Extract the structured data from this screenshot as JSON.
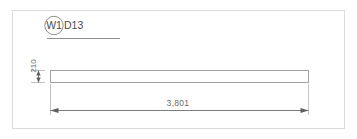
{
  "drawing": {
    "type": "structural-beam-elevation",
    "frame": {
      "border_color": "#d8d8d8",
      "background": "#ffffff"
    },
    "mark": {
      "circle_label": "W1",
      "section_label": "D13",
      "combined": "W1 D13",
      "balloon_shape": "circle",
      "underline": true
    },
    "member": {
      "outline_color": "#9a9a9a",
      "shape": "rectangle",
      "depth_label": "210",
      "length_label": "3,801"
    },
    "dimensions": [
      {
        "name": "depth",
        "value": "210",
        "orientation": "vertical",
        "arrow_style": "filled-arrowheads",
        "color": "#6a6a6a"
      },
      {
        "name": "length",
        "value": "3,801",
        "orientation": "horizontal",
        "arrow_style": "filled-arrowheads",
        "color": "#6a6a6a"
      }
    ],
    "line_colors": {
      "outline": "#9a9a9a",
      "dimension": "#808080",
      "extension": "#b5b5b5",
      "leader": "#7a7a7a"
    }
  }
}
